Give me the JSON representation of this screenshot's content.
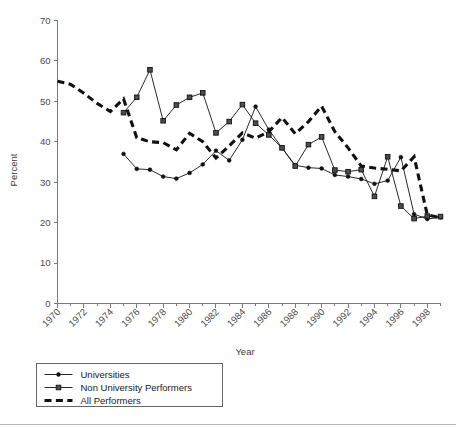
{
  "chart_data": {
    "type": "line",
    "title": "",
    "xlabel": "Year",
    "ylabel": "Percent",
    "xlim": [
      1970,
      1999
    ],
    "ylim": [
      0,
      70
    ],
    "ytick_step": 10,
    "yticks": [
      0,
      10,
      20,
      30,
      40,
      50,
      60,
      70
    ],
    "xticks_major": [
      1970,
      1972,
      1974,
      1976,
      1978,
      1980,
      1982,
      1984,
      1986,
      1988,
      1990,
      1992,
      1994,
      1996,
      1998
    ],
    "xticks_minor_step": 1,
    "grid": false,
    "legend_position": "below-left",
    "x": [
      1970,
      1971,
      1972,
      1973,
      1974,
      1975,
      1976,
      1977,
      1978,
      1979,
      1980,
      1981,
      1982,
      1983,
      1984,
      1985,
      1986,
      1987,
      1988,
      1989,
      1990,
      1991,
      1992,
      1993,
      1994,
      1995,
      1996,
      1997,
      1998,
      1999
    ],
    "series": [
      {
        "name": "Universities",
        "marker": "circle",
        "line_style": "solid-thin",
        "x": [
          1975,
          1976,
          1977,
          1978,
          1979,
          1980,
          1981,
          1982,
          1983,
          1984,
          1985,
          1986,
          1987,
          1988,
          1989,
          1990,
          1991,
          1992,
          1993,
          1994,
          1995,
          1996,
          1997,
          1998,
          1999
        ],
        "values": [
          37.0,
          33.3,
          33.1,
          31.4,
          30.9,
          32.3,
          34.4,
          37.8,
          35.4,
          40.5,
          48.7,
          43.0,
          38.5,
          34.2,
          33.6,
          33.4,
          31.8,
          31.4,
          30.8,
          29.6,
          30.4,
          36.2,
          22.1,
          20.9,
          21.3
        ]
      },
      {
        "name": "Non University Performers",
        "marker": "square",
        "line_style": "solid-thin",
        "x": [
          1975,
          1976,
          1977,
          1978,
          1979,
          1980,
          1981,
          1982,
          1983,
          1984,
          1985,
          1986,
          1987,
          1988,
          1989,
          1990,
          1991,
          1992,
          1993,
          1994,
          1995,
          1996,
          1997,
          1998,
          1999
        ],
        "values": [
          47.2,
          51.0,
          57.8,
          45.2,
          49.1,
          51.0,
          52.1,
          42.2,
          45.0,
          49.2,
          44.6,
          41.7,
          38.5,
          34.0,
          39.3,
          41.2,
          33.0,
          32.6,
          33.1,
          26.5,
          36.3,
          24.1,
          21.0,
          21.6,
          21.5
        ]
      },
      {
        "name": "All Performers",
        "marker": "none",
        "line_style": "dashed-thick",
        "x": [
          1970,
          1971,
          1972,
          1973,
          1974,
          1975,
          1976,
          1977,
          1978,
          1979,
          1980,
          1981,
          1982,
          1983,
          1984,
          1985,
          1986,
          1987,
          1988,
          1989,
          1990,
          1991,
          1992,
          1993,
          1994,
          1995,
          1996,
          1997,
          1998,
          1999
        ],
        "values": [
          55.0,
          54.2,
          52.0,
          49.5,
          47.5,
          50.6,
          41.0,
          40.0,
          39.8,
          38.0,
          42.1,
          40.0,
          36.0,
          39.0,
          42.2,
          40.9,
          42.5,
          46.0,
          42.0,
          45.0,
          48.8,
          42.5,
          38.5,
          34.0,
          33.5,
          33.2,
          32.8,
          36.3,
          21.9,
          21.2
        ]
      }
    ]
  },
  "legend": {
    "items": [
      {
        "label": "Universities",
        "marker": "circle",
        "style": "solid-thin"
      },
      {
        "label": "Non University Performers",
        "marker": "square",
        "style": "solid-thin"
      },
      {
        "label": "All Performers",
        "marker": "none",
        "style": "dashed-thick"
      }
    ]
  }
}
